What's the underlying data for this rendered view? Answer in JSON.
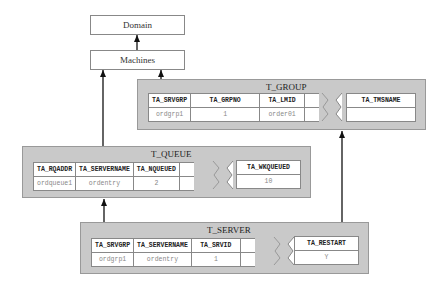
{
  "domain_box": {
    "label": "Domain"
  },
  "machines_box": {
    "label": "Machines"
  },
  "t_group": {
    "title": "T_GROUP",
    "headers": [
      "TA_SRVGRP",
      "TA_GRPNO",
      "TA_LMID"
    ],
    "values": [
      "ordgrp1",
      "1",
      "order01"
    ],
    "extra_header": "TA_TMSNAME",
    "extra_value": ""
  },
  "t_queue": {
    "title": "T_QUEUE",
    "headers": [
      "TA_RQADDR",
      "TA_SERVERNAME",
      "TA_NQUEUED"
    ],
    "values": [
      "ordqueue1",
      "ordentry",
      "2"
    ],
    "extra_header": "TA_WKQUEUED",
    "extra_value": "10"
  },
  "t_server": {
    "title": "T_SERVER",
    "headers": [
      "TA_SRVGRP",
      "TA_SERVERNAME",
      "TA_SRVID"
    ],
    "values": [
      "ordgrp1",
      "ordentry",
      "1"
    ],
    "extra_header": "TA_RESTART",
    "extra_value": "Y"
  }
}
